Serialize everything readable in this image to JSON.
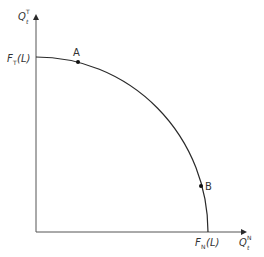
{
  "diagram": {
    "type": "production-possibility-frontier",
    "colors": {
      "line": "#2a2a2a",
      "text": "#333333",
      "background": "#ffffff"
    },
    "y_axis": {
      "label_main": "Q",
      "label_sup": "T",
      "label_sub": "t"
    },
    "x_axis": {
      "label_main": "Q",
      "label_sup": "N",
      "label_sub": "t"
    },
    "y_intercept": {
      "label_main": "F",
      "label_sub": "T",
      "label_arg": "(L)"
    },
    "x_intercept": {
      "label_main": "F",
      "label_sub": "N",
      "label_arg": "(L)"
    },
    "points": [
      {
        "id": "A",
        "label": "A"
      },
      {
        "id": "B",
        "label": "B"
      }
    ]
  }
}
